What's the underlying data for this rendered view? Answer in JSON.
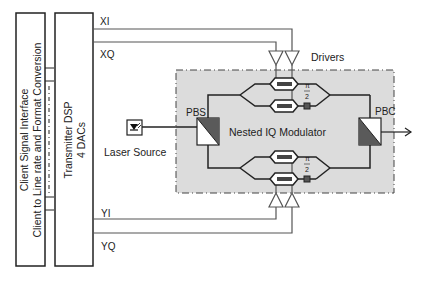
{
  "blocks": {
    "client_interface": {
      "line1": "Client Signal Interface",
      "line2": "Client to Line rate and Format Conversion"
    },
    "transmitter_dsp": {
      "line1": "Transmitter DSP",
      "line2": "4 DACs"
    },
    "laser_source": {
      "label": "Laser Source"
    },
    "pbs": {
      "label": "PBS"
    },
    "pbc": {
      "label": "PBC"
    },
    "modulator": {
      "label": "Nested IQ Modulator"
    },
    "drivers": {
      "label": "Drivers"
    }
  },
  "signals": {
    "xi": "XI",
    "xq": "XQ",
    "yi": "YI",
    "yq": "YQ"
  },
  "phase_shift": {
    "top_num": "π",
    "top_den": "2",
    "bottom_num": "π",
    "bottom_den": "2"
  },
  "colors": {
    "line": "#222222",
    "signal_line": "#555555",
    "modulator_fill": "#dcdcdc",
    "splitter_dark": "#5a5a5a"
  }
}
